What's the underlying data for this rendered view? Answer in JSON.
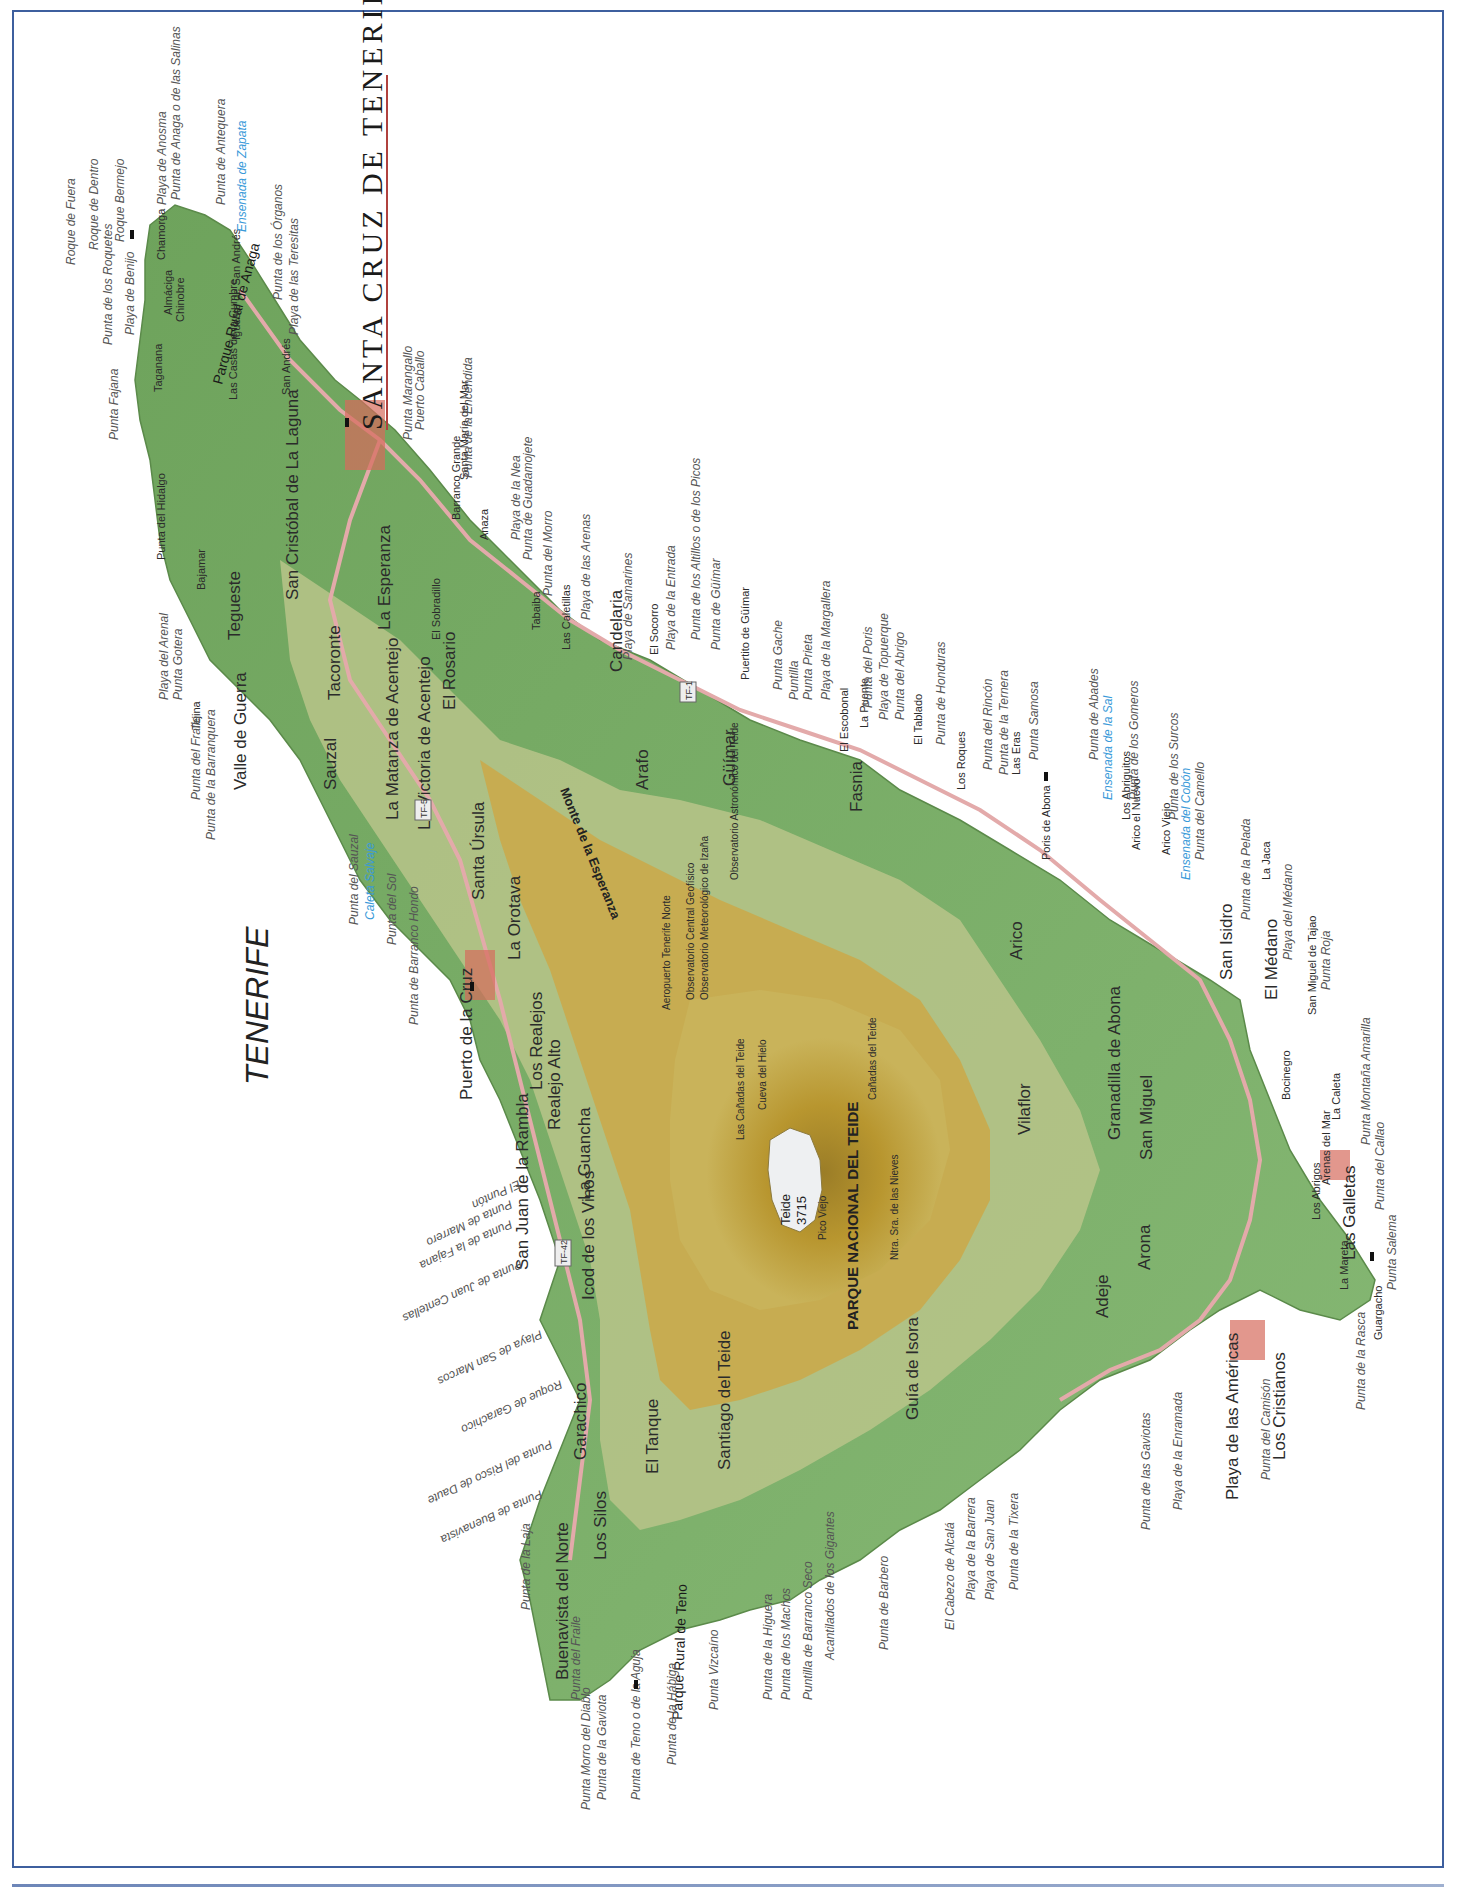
{
  "map": {
    "island_title": "TENERIFE",
    "capital_title": "SANTA CRUZ DE TENERIFE",
    "national_park": "PARQUE NACIONAL DEL TEIDE",
    "summit": {
      "name": "Teide",
      "elevation": "3715"
    },
    "ridge": "Monte de la Esperanza",
    "parks": [
      "Parque Rural de Anaga",
      "Parque Rural de Teno"
    ],
    "colors": {
      "lowland": "#7fb36a",
      "midland": "#b9c48a",
      "upland": "#c9a94a",
      "highland": "#a88a2e",
      "summit": "#e8ecef",
      "road": "#e7b8b8",
      "frame": "#3d5f9e",
      "bay_text": "#3a9ad9"
    }
  },
  "towns": {
    "major": [
      "San Cristóbal de La Laguna",
      "Puerto de la Cruz",
      "Candelaria",
      "Güímar",
      "Los Cristianos",
      "Playa de las Américas",
      "Adeje",
      "Guía de Isora",
      "Buenavista del Norte",
      "Icod de los Vinos",
      "La Orotava",
      "Granadilla de Abona",
      "San Miguel",
      "Arona",
      "Santiago del Teide",
      "Tacoronte",
      "Tegueste",
      "Sauzal",
      "Valle de Guerra",
      "La Matanza de Acentejo",
      "La Victoria de Acentejo",
      "Santa Úrsula",
      "Los Realejos",
      "La Guancha",
      "Garachico",
      "Los Silos",
      "Fasnia",
      "Arico",
      "Vilaflor",
      "El Rosario",
      "La Esperanza",
      "Arafo",
      "El Tanque",
      "San Isidro",
      "Las Galletas",
      "El Médano",
      "San Juan de la Rambla",
      "Realejo Alto"
    ],
    "minor": [
      "Tejina",
      "Bajamar",
      "Punta del Hidalgo",
      "Taganana",
      "Almáciga",
      "Chinobre",
      "Chamorga",
      "Igueste de San Andrés",
      "San Andrés",
      "Las Casas de la Cumbre",
      "El Sobradillo",
      "Barranco Grande",
      "Santa María del Mar",
      "Anaza",
      "Tabaiba",
      "Las Caletillas",
      "El Socorro",
      "Puertito de Güímar",
      "El Escobonal",
      "La Puente",
      "El Tablado",
      "Los Roques",
      "Las Eras",
      "Poris de Abona",
      "Los Abriguitos",
      "Arico el Nuevo",
      "Arico Viejo",
      "La Jaca",
      "San Miguel de Tajao",
      "La Caleta",
      "Arenas del Mar",
      "Bocinegro",
      "Los Abrigos",
      "La Mareta",
      "Guargacho",
      "Las Rosas",
      "El Fraile",
      "Palm-Mar",
      "Guaza",
      "Buzanada",
      "Cabo Blanco",
      "Chayofa",
      "Valle de San Lorenzo",
      "La Escalona",
      "Ifonche",
      "Taucho",
      "Tijoco Alto",
      "Tijoco Bajo",
      "Los Menores",
      "Armeñime",
      "El Puertito",
      "Fañabé",
      "San Eugenio Bajo",
      "El Guincho",
      "Playa Paraíso",
      "Callao Salvaje",
      "Marazul",
      "Alcalá",
      "El Varadero",
      "Puerto de Santiago",
      "Chío",
      "Tamaimo",
      "Las Manchas",
      "Masca",
      "Los Carrizales",
      "Erjos",
      "Las Portelas",
      "El Palmar",
      "Teno",
      "Ruigómez",
      "La Montañeta",
      "San Pedro de Daute",
      "El Guincho",
      "La Vega",
      "Las Dehesas",
      "Punta Brava",
      "San Agustín",
      "Icod el Alto",
      "Perdoma",
      "Aguamansa",
      "La Florida",
      "Dehesa Alta",
      "Ravelo",
      "Juan Fernández",
      "Puerto de la Madera",
      "Mesa del Mar",
      "Guamasa",
      "El Ortigal",
      "Los Rodeos",
      "El Portezuelo",
      "Las Lagunetas",
      "Tejina de Isora",
      "Chiguergue",
      "Chirche",
      "Aripe",
      "El Jaral",
      "Acojeja",
      "Vera de Erques",
      "Abama",
      "Igueste",
      "Malpaís",
      "Araya",
      "Las Cuevecitas",
      "La Hidalga",
      "Pájara",
      "La Medida",
      "Lomo de Mena",
      "Agüerche",
      "La Zarza",
      "Sabina Alta",
      "Los Gomeros",
      "La Sombrera",
      "Icor",
      "La Cisnera",
      "El Río",
      "Chimiche",
      "La Cantera",
      "El Desierto",
      "Castro",
      "Las Zocas",
      "Aldea Blanca",
      "Atogo",
      "Lomito del Llano",
      "Lomo de la Alegría"
    ],
    "observatories": [
      "Observatorio Astronómico del Teide",
      "Observatorio Central Geofísico",
      "Observatorio Meteorológico de Izaña"
    ],
    "interior": [
      "Las Cañadas del Teide",
      "Cueva del Hielo",
      "Cañadas del Teide",
      "Ntra. Sra. de las Nieves",
      "Pico Viejo",
      "Valle de la Orotava",
      "Benijos",
      "Macizo de Teno",
      "Aeropuerto Tenerife Norte",
      "Aeropuerto Tenerife Sur"
    ]
  },
  "coast": {
    "north": [
      "Roque de Fuera",
      "Roque de Dentro",
      "Punta de los Roquetes",
      "Las Palmas",
      "Roque Bermejo",
      "Playa de Benijo",
      "Punta Fajana",
      "Playa de Anosma",
      "Punta de Anaga o de las Salinas",
      "Punta de Antequera",
      "Punta de los Órganos",
      "Playa de las Teresitas",
      "Playa del Arenal",
      "Punta Gotera",
      "Punta del Fraile",
      "Punta de la Barranquera",
      "Punta del Sauzal",
      "Punta del Sol",
      "Punta de Barranco Hondo",
      "El Puntón",
      "Punta de Marrero",
      "Punta de la Fajana",
      "Punta de Juan Centellas",
      "Playa de San Marcos",
      "Roque de Garachico",
      "Punta del Risco de Daute",
      "Punta de Buenavista",
      "Punta de la Laja"
    ],
    "east": [
      "Punta Marangallo",
      "Puerto Caballo",
      "Punta de la Encendida",
      "Playa de la Nea",
      "Punta de Guadamojete",
      "Punta del Morro",
      "Playa de las Arenas",
      "Playa de Samarines",
      "Playa de la Entrada",
      "Punta de los Altillos o de los Picos",
      "Punta de Güímar",
      "Punta Gache",
      "Puntilla",
      "Punta Prieta",
      "Playa de la Margallera",
      "Punta del Poris",
      "Playa de Topuerque",
      "Punta del Abrigo",
      "Punta de Honduras",
      "Punta del Rincón",
      "Punta de la Ternera",
      "Punta Samosa",
      "Punta de Abona",
      "Punta de Abades",
      "Punta de los Gomeros",
      "Punta de los Surcos",
      "Punta del Camello",
      "Punta de la Pelada",
      "Playa del Médano",
      "Punta Roja",
      "Punta Montaña Amarilla",
      "Punta del Callao",
      "Punta Salema"
    ],
    "south_west": [
      "Punta de la Rasca",
      "Punta del Camisón",
      "Playa de la Enramada",
      "Punta de las Gaviotas",
      "Punta de la Tixera",
      "Playa de San Juan",
      "Playa de la Barrera",
      "El Cabezo de Alcalá",
      "Punta de Barbero",
      "Acantilados de los Gigantes",
      "Puntilla de Barranco Seco",
      "Punta de los Machos",
      "Punta de la Higuera",
      "Punta Vizcaíno",
      "Punta de la Hábiga",
      "Punta de Teno o de la Aguja",
      "Punta de la Gaviota",
      "Punta Morro del Diablo",
      "Punta del Fraile"
    ],
    "bays": [
      "Ensenada de Zapata",
      "Ensenada de la Sal",
      "Ensenada del Cobón",
      "Caleta Salvaje"
    ]
  },
  "elevations": [
    "1050",
    "399",
    "983",
    "460",
    "1415",
    "1405",
    "1163",
    "1003",
    "430",
    "155",
    "36",
    "61",
    "110",
    "2715",
    "2255",
    "2156"
  ],
  "roads": [
    "TF-1",
    "TF-5",
    "TF-42"
  ]
}
